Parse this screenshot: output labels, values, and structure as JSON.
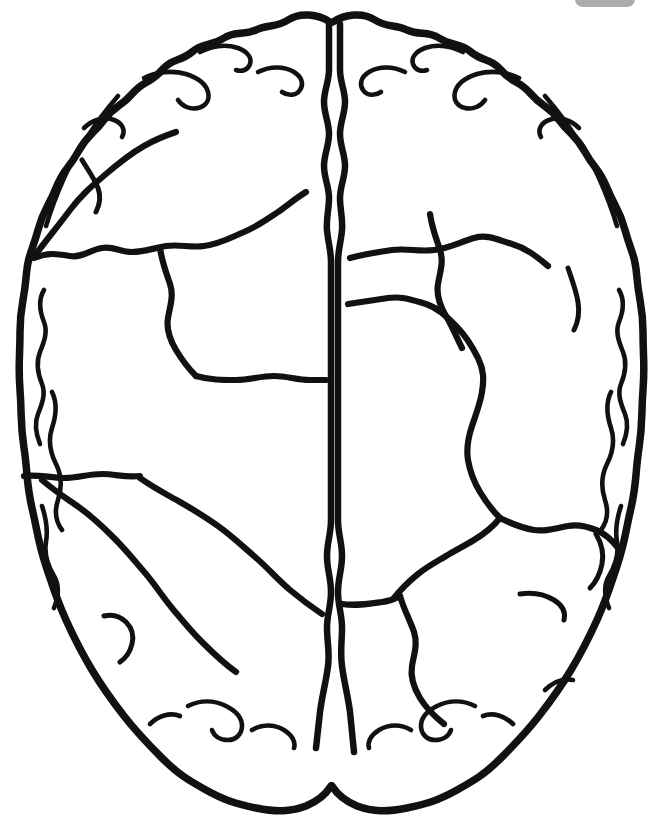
{
  "page": {
    "width": 663,
    "height": 821,
    "background_color": "#ffffff",
    "ink_color": "#111111",
    "style": "black-and-white outline / coloring-book line art",
    "alt_text": "Line drawing of a human brain seen from above, showing two cerebral hemispheres separated by the longitudinal fissure, with wavy gyri along the outer border and interior sulcus lines dividing each hemisphere into lobe-like regions."
  },
  "figure": {
    "subject": "human brain",
    "view": "superior axial view",
    "hemispheres": [
      {
        "name": "left-hemisphere",
        "side": "left"
      },
      {
        "name": "right-hemisphere",
        "side": "right"
      }
    ],
    "features": [
      {
        "name": "longitudinal-fissure",
        "description": "vertical midline cleft drawn as a double wavy line at top and bottom, single line through the middle"
      },
      {
        "name": "gyri-outline",
        "description": "wavy convolution border around the whole cerebrum"
      },
      {
        "name": "left-sulcus-lines",
        "description": "interior dividing lines in the left hemisphere"
      },
      {
        "name": "right-sulcus-lines",
        "description": "interior dividing lines in the right hemisphere"
      }
    ]
  },
  "overlay": {
    "top_right_chip": {
      "name": "status-chip",
      "color": "#8c8c8c",
      "label": ""
    }
  },
  "chart_data": {
    "type": "line",
    "xlabel": "",
    "ylabel": "",
    "xlim": [
      0,
      663
    ],
    "ylim": [
      0,
      821
    ],
    "grid": false,
    "legend": "none",
    "series": [
      {
        "name": "outer-cerebrum-outline",
        "role": "outline",
        "stroke": "#111111",
        "width": 7.5,
        "closed": true,
        "path": "M 330 22 C 318 14 300 12 288 20 C 276 28 268 24 256 30 C 243 36 236 30 224 38 C 210 47 204 42 192 52 C 180 62 172 58 162 70 C 150 84 144 80 132 94 C 120 108 116 104 104 120 C 92 136 88 134 78 152 C 68 170 64 168 56 188 C 48 208 44 208 38 230 C 32 252 28 254 26 278 C 24 302 20 306 20 332 C 20 358 18 364 20 390 C 22 416 20 422 24 448 C 28 474 26 482 32 508 C 38 534 38 542 46 566 C 54 590 56 598 66 620 C 76 642 80 650 92 670 C 104 690 110 698 124 716 C 138 734 146 742 162 758 C 178 774 188 780 206 790 C 224 800 236 804 256 808 C 276 812 290 812 306 806 C 318 801 326 794 331 786"
      },
      {
        "name": "outer-cerebrum-outline-right",
        "role": "outline",
        "stroke": "#111111",
        "width": 7.5,
        "closed": false,
        "path": "M 333 22 C 345 14 363 12 375 20 C 387 28 395 24 407 30 C 420 36 427 30 439 38 C 453 47 459 42 471 52 C 483 62 491 58 501 70 C 513 84 519 80 531 94 C 543 108 547 104 559 120 C 571 136 575 134 585 152 C 595 170 599 168 607 188 C 615 208 619 208 625 230 C 631 252 635 254 637 278 C 639 302 643 306 643 332 C 643 358 645 364 643 390 C 641 416 643 422 639 448 C 635 474 637 482 631 508 C 625 534 625 542 617 566 C 609 590 607 598 597 620 C 587 642 583 650 571 670 C 559 690 553 698 539 716 C 525 734 517 742 501 758 C 485 774 475 780 457 790 C 439 800 427 804 407 808 C 387 812 373 812 357 806 C 345 801 337 794 332 786"
      },
      {
        "name": "longitudinal-fissure-left-line",
        "role": "fissure",
        "stroke": "#111111",
        "width": 6.5,
        "path": "M 329 24 L 329 70 C 329 82 324 90 324 102 C 324 114 329 122 329 134 C 329 146 324 154 324 166 C 324 178 329 186 329 198 C 329 210 326 218 327 230 C 328 242 331 250 331 262 L 331 520 C 331 534 327 542 327 556 C 327 570 331 578 331 592 C 331 606 327 614 327 628 C 327 642 330 652 328 666 C 326 682 322 696 320 712 L 316 748"
      },
      {
        "name": "longitudinal-fissure-right-line",
        "role": "fissure",
        "stroke": "#111111",
        "width": 6.5,
        "path": "M 340 24 L 340 70 C 340 82 345 90 345 102 C 345 114 340 122 340 134 C 340 146 345 154 345 166 C 345 178 340 186 340 198 C 340 210 343 218 342 230 C 341 242 338 250 338 262 L 338 520 C 338 534 342 542 342 556 C 342 570 338 578 338 592 C 338 606 342 614 342 628 C 342 642 340 652 342 666 C 344 682 348 696 350 712 L 354 752"
      },
      {
        "name": "left-outer-gyrus-inner-line-upper",
        "role": "gyrus",
        "stroke": "#111111",
        "width": 4.6,
        "path": "M 118 96 C 106 110 98 120 88 136 C 78 152 72 160 64 178 C 56 196 52 206 46 226"
      },
      {
        "name": "left-outer-gyrus-inner-line-mid",
        "role": "gyrus",
        "stroke": "#111111",
        "width": 4.6,
        "path": "M 44 290 C 38 300 40 312 44 322 C 48 332 44 342 40 352 C 36 362 38 374 42 384 C 46 394 42 404 38 414 C 34 424 36 434 40 444"
      },
      {
        "name": "left-outer-gyrus-inner-line-lower",
        "role": "gyrus",
        "stroke": "#111111",
        "width": 4.6,
        "path": "M 52 392 C 58 404 56 416 52 428 C 48 440 50 452 56 464 C 62 476 62 488 58 500 C 54 512 56 522 62 530"
      },
      {
        "name": "left-outer-gyrus-inner-line-bottomleft",
        "role": "gyrus",
        "stroke": "#111111",
        "width": 4.6,
        "path": "M 42 506 C 46 518 48 530 46 542 C 44 554 48 566 54 576 C 60 586 58 598 54 608"
      },
      {
        "name": "left-frontal-gyrus-arc-a",
        "role": "gyrus",
        "stroke": "#111111",
        "width": 4.6,
        "path": "M 200 52 C 212 46 226 44 238 48 C 248 52 252 58 250 64 C 248 70 242 72 236 70"
      },
      {
        "name": "left-frontal-gyrus-arc-b",
        "role": "gyrus",
        "stroke": "#111111",
        "width": 4.6,
        "path": "M 144 78 C 156 72 172 70 186 74 C 198 78 206 84 208 92 C 210 100 206 106 198 108 C 190 110 182 106 178 100"
      },
      {
        "name": "left-frontal-gyrus-arc-c",
        "role": "gyrus",
        "stroke": "#111111",
        "width": 4.6,
        "path": "M 258 72 C 270 66 284 66 294 72 C 302 77 304 84 300 90 C 296 96 288 96 282 92"
      },
      {
        "name": "left-frontal-gyrus-arc-d",
        "role": "gyrus",
        "stroke": "#111111",
        "width": 4.6,
        "path": "M 84 128 C 92 120 104 116 114 120 C 122 123 126 130 122 137"
      },
      {
        "name": "left-sulcus-central-diagonal",
        "role": "sulcus-major",
        "stroke": "#111111",
        "width": 6.2,
        "path": "M 36 254 C 48 238 58 226 70 210 C 82 194 92 186 106 174 C 120 162 130 154 144 146 C 156 139 164 136 176 132"
      },
      {
        "name": "left-sulcus-upper-branch",
        "role": "sulcus-minor",
        "stroke": "#111111",
        "width": 5.0,
        "path": "M 82 160 C 88 170 94 178 98 188 C 101 196 100 204 96 212"
      },
      {
        "name": "left-sulcus-horizontal-upper",
        "role": "sulcus-major",
        "stroke": "#111111",
        "width": 6.2,
        "path": "M 34 258 C 48 252 58 254 70 256 C 82 258 90 250 102 248 C 114 246 120 252 132 252 C 144 252 154 248 166 246 C 180 244 190 248 204 246 C 220 244 230 238 244 232 C 258 226 266 220 278 212 C 288 205 296 198 306 192"
      },
      {
        "name": "left-sulcus-vertical-mid",
        "role": "sulcus-major",
        "stroke": "#111111",
        "width": 6.2,
        "path": "M 160 248 C 162 262 166 272 170 284 C 174 296 170 306 168 318 C 166 330 170 340 176 350 C 182 360 188 368 196 376"
      },
      {
        "name": "left-sulcus-horizontal-lower",
        "role": "sulcus-major",
        "stroke": "#111111",
        "width": 6.2,
        "path": "M 196 376 C 210 380 222 380 236 380 C 250 380 260 376 274 376 C 288 376 296 380 310 380 L 326 380"
      },
      {
        "name": "left-sulcus-descending-from-edge",
        "role": "sulcus-major",
        "stroke": "#111111",
        "width": 6.2,
        "path": "M 24 476 C 38 474 50 478 64 478 C 78 478 88 474 102 474 C 116 474 126 478 140 476"
      },
      {
        "name": "left-sulcus-mid-diagonal",
        "role": "sulcus-major",
        "stroke": "#111111",
        "width": 6.2,
        "path": "M 42 480 C 56 492 66 498 80 508 C 94 518 102 526 114 538 C 126 550 134 560 146 574 C 156 586 162 596 172 608 C 182 620 190 630 202 642 C 214 654 222 662 236 672"
      },
      {
        "name": "left-sulcus-temporal-arc",
        "role": "sulcus-major",
        "stroke": "#111111",
        "width": 6.2,
        "path": "M 140 478 C 154 488 166 494 180 502 C 194 510 204 516 218 526 C 232 536 240 544 254 556 C 268 568 276 578 290 590 C 302 600 310 606 322 614"
      },
      {
        "name": "left-sulcus-lower-branch",
        "role": "sulcus-minor",
        "stroke": "#111111",
        "width": 5.0,
        "path": "M 104 616 C 112 614 120 616 126 622 C 132 628 134 636 132 644 C 130 652 126 658 120 662"
      },
      {
        "name": "left-occipital-gyrus-a",
        "role": "gyrus",
        "stroke": "#111111",
        "width": 4.6,
        "path": "M 188 706 C 200 700 214 700 226 706 C 236 711 242 718 242 726 C 242 734 236 740 228 740 C 220 740 214 736 212 730"
      },
      {
        "name": "left-occipital-gyrus-b",
        "role": "gyrus",
        "stroke": "#111111",
        "width": 4.6,
        "path": "M 252 730 C 262 724 274 724 284 730 C 292 735 296 742 294 748"
      },
      {
        "name": "left-occipital-gyrus-c",
        "role": "gyrus",
        "stroke": "#111111",
        "width": 4.6,
        "path": "M 150 724 C 158 716 170 712 180 716"
      },
      {
        "name": "right-outer-gyrus-inner-line-upper",
        "role": "gyrus",
        "stroke": "#111111",
        "width": 4.6,
        "path": "M 545 96 C 557 110 565 120 575 136 C 585 152 591 160 599 178 C 607 196 611 206 617 226"
      },
      {
        "name": "right-outer-gyrus-inner-line-mid",
        "role": "gyrus",
        "stroke": "#111111",
        "width": 4.6,
        "path": "M 619 290 C 625 300 623 312 619 322 C 615 332 619 342 623 352 C 627 362 625 374 621 384 C 617 394 621 404 625 414 C 629 424 627 434 623 444"
      },
      {
        "name": "right-outer-gyrus-inner-line-lower",
        "role": "gyrus",
        "stroke": "#111111",
        "width": 4.6,
        "path": "M 611 392 C 605 404 607 416 611 428 C 615 440 613 452 607 464 C 601 476 601 488 605 500 C 609 512 607 522 601 530"
      },
      {
        "name": "right-outer-gyrus-inner-line-bottomright",
        "role": "gyrus",
        "stroke": "#111111",
        "width": 4.6,
        "path": "M 621 506 C 617 518 615 530 617 542 C 619 554 615 566 609 576 C 603 586 605 598 609 608"
      },
      {
        "name": "right-frontal-gyrus-arc-a",
        "role": "gyrus",
        "stroke": "#111111",
        "width": 4.6,
        "path": "M 463 52 C 451 46 437 44 425 48 C 415 52 411 58 413 64 C 415 70 421 72 427 70"
      },
      {
        "name": "right-frontal-gyrus-arc-b",
        "role": "gyrus",
        "stroke": "#111111",
        "width": 4.6,
        "path": "M 519 78 C 507 72 491 70 477 74 C 465 78 457 84 455 92 C 453 100 457 106 465 108 C 473 110 481 106 485 100"
      },
      {
        "name": "right-frontal-gyrus-arc-c",
        "role": "gyrus",
        "stroke": "#111111",
        "width": 4.6,
        "path": "M 405 72 C 393 66 379 66 369 72 C 361 77 359 84 363 90 C 367 96 375 96 381 92"
      },
      {
        "name": "right-frontal-gyrus-arc-d",
        "role": "gyrus",
        "stroke": "#111111",
        "width": 4.6,
        "path": "M 579 128 C 571 120 559 116 549 120 C 541 123 537 130 541 137"
      },
      {
        "name": "right-sulcus-central-diagonal",
        "role": "sulcus-major",
        "stroke": "#111111",
        "width": 6.2,
        "path": "M 350 258 C 364 254 378 252 392 250 C 408 248 418 252 434 250 C 450 248 460 242 474 238 C 488 234 498 240 512 244 C 526 248 536 256 548 266"
      },
      {
        "name": "right-sulcus-vertical-upper",
        "role": "sulcus-major",
        "stroke": "#111111",
        "width": 6.2,
        "path": "M 430 214 C 432 228 436 238 440 250 C 444 262 440 272 438 284 C 436 296 440 306 446 316 C 452 326 456 336 462 348"
      },
      {
        "name": "right-sulcus-long-diagonal",
        "role": "sulcus-major",
        "stroke": "#111111",
        "width": 6.2,
        "path": "M 348 304 C 362 302 374 300 388 298 C 402 296 412 300 426 304 C 438 308 446 316 456 326 C 466 336 472 346 478 358 C 484 370 484 380 482 392 C 480 404 476 414 472 426 C 468 438 466 448 468 460 C 470 472 474 482 480 492 C 486 502 492 510 500 518"
      },
      {
        "name": "right-sulcus-junction-horizontal",
        "role": "sulcus-major",
        "stroke": "#111111",
        "width": 6.2,
        "path": "M 500 518 C 512 524 522 528 534 530 C 546 532 556 528 568 526 C 578 524 586 526 596 530 C 606 534 612 540 618 548"
      },
      {
        "name": "right-sulcus-mid-branch-down",
        "role": "sulcus-major",
        "stroke": "#111111",
        "width": 6.2,
        "path": "M 500 518 C 492 528 484 534 474 540 C 464 546 456 550 446 556 C 436 562 428 566 418 574 C 408 582 402 588 394 598"
      },
      {
        "name": "right-sulcus-lower-horizontal",
        "role": "sulcus-major",
        "stroke": "#111111",
        "width": 6.2,
        "path": "M 342 604 C 356 606 368 604 382 602 C 392 601 396 598 400 596"
      },
      {
        "name": "right-sulcus-vertical-lower",
        "role": "sulcus-major",
        "stroke": "#111111",
        "width": 6.2,
        "path": "M 400 596 C 404 610 410 620 414 632 C 418 644 414 654 412 666 C 410 678 414 688 420 698 C 426 708 434 716 444 724"
      },
      {
        "name": "right-sulcus-edge-branch",
        "role": "sulcus-minor",
        "stroke": "#111111",
        "width": 5.0,
        "path": "M 568 268 C 572 280 576 290 578 302 C 580 314 578 322 574 330"
      },
      {
        "name": "right-sulcus-edge-branch-2",
        "role": "sulcus-minor",
        "stroke": "#111111",
        "width": 5.0,
        "path": "M 596 534 C 602 544 604 554 602 564 C 600 574 596 582 590 588"
      },
      {
        "name": "right-sulcus-temporal-arc",
        "role": "sulcus-minor",
        "stroke": "#111111",
        "width": 5.0,
        "path": "M 520 594 C 532 592 544 594 554 600 C 562 605 566 612 564 620"
      },
      {
        "name": "right-occipital-gyrus-a",
        "role": "gyrus",
        "stroke": "#111111",
        "width": 4.6,
        "path": "M 475 706 C 463 700 449 700 437 706 C 427 711 421 718 421 726 C 421 734 427 740 435 740 C 443 740 449 736 451 730"
      },
      {
        "name": "right-occipital-gyrus-b",
        "role": "gyrus",
        "stroke": "#111111",
        "width": 4.6,
        "path": "M 411 730 C 401 724 389 724 379 730 C 371 735 367 742 369 748"
      },
      {
        "name": "right-occipital-gyrus-c",
        "role": "gyrus",
        "stroke": "#111111",
        "width": 4.6,
        "path": "M 513 724 C 505 716 493 712 483 716"
      },
      {
        "name": "right-occipital-gyrus-d",
        "role": "gyrus",
        "stroke": "#111111",
        "width": 4.6,
        "path": "M 545 690 C 553 682 563 678 573 680"
      }
    ]
  }
}
